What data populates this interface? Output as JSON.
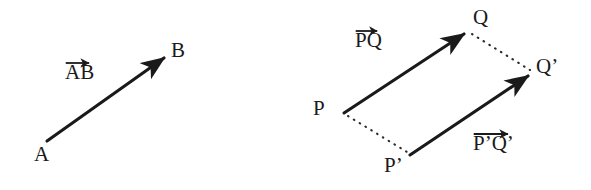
{
  "diagram": {
    "background_color": "#ffffff",
    "stroke_color": "#1a1a1a",
    "dotted_color": "#2b2b2b",
    "left_figure": {
      "name": "single-vector-AB",
      "points": [
        {
          "id": "A",
          "label": "A",
          "x": 47,
          "y": 141
        },
        {
          "id": "B",
          "label": "B",
          "x": 168,
          "y": 55
        }
      ],
      "vectors": [
        {
          "id": "AB",
          "label": "AB",
          "from": "A",
          "to": "B",
          "x1": 47,
          "y1": 141,
          "x2": 168,
          "y2": 55,
          "style": "solid",
          "arrowhead": "end"
        }
      ]
    },
    "right_figure": {
      "name": "equal-vectors-PQ-PpQp",
      "points": [
        {
          "id": "P",
          "label": "P",
          "x": 344,
          "y": 113
        },
        {
          "id": "Q",
          "label": "Q",
          "x": 468,
          "y": 31
        },
        {
          "id": "Pp",
          "label": "P’",
          "x": 410,
          "y": 155
        },
        {
          "id": "Qp",
          "label": "Q’",
          "x": 532,
          "y": 73
        }
      ],
      "vectors": [
        {
          "id": "PQ",
          "label": "PQ",
          "from": "P",
          "to": "Q",
          "x1": 344,
          "y1": 113,
          "x2": 468,
          "y2": 31,
          "style": "solid",
          "arrowhead": "end"
        },
        {
          "id": "PpQp",
          "label": "P’Q’",
          "from": "Pp",
          "to": "Qp",
          "x1": 410,
          "y1": 155,
          "x2": 532,
          "y2": 73,
          "style": "solid",
          "arrowhead": "end"
        }
      ],
      "connectors": [
        {
          "id": "P-to-Pp",
          "from": "P",
          "to": "Pp",
          "x1": 348,
          "y1": 116,
          "x2": 407,
          "y2": 152,
          "style": "dotted"
        },
        {
          "id": "Q-to-Qp",
          "from": "Q",
          "to": "Qp",
          "x1": 472,
          "y1": 34,
          "x2": 530,
          "y2": 70,
          "style": "dotted"
        }
      ]
    },
    "labels": {
      "A": "A",
      "B": "B",
      "P": "P",
      "Q": "Q",
      "P_prime": "P’",
      "Q_prime": "Q’",
      "vector_AB": "AB",
      "vector_PQ": "PQ",
      "vector_PpQp": "P’Q’"
    }
  }
}
